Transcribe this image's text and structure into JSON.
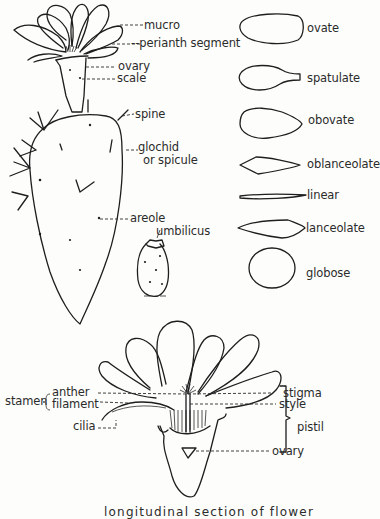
{
  "diagram": {
    "cactus_labels": {
      "mucro": "mucro",
      "perianth_segment": "perianth segment",
      "ovary": "ovary",
      "scale": "scale",
      "spine": "spine",
      "glochid_line1": "glochid",
      "glochid_line2": "or spicule",
      "areole": "areole",
      "umbilicus": "umbilicus"
    },
    "leaf_shapes": [
      {
        "name": "ovate"
      },
      {
        "name": "spatulate"
      },
      {
        "name": "obovate"
      },
      {
        "name": "oblanceolate"
      },
      {
        "name": "linear"
      },
      {
        "name": "lanceolate"
      },
      {
        "name": "globose"
      }
    ],
    "flower_section_labels": {
      "stamen": "stamen",
      "anther": "anther",
      "filament": "filament",
      "cilia": "cilia",
      "stigma": "stigma",
      "style": "style",
      "pistil": "pistil",
      "ovary": "ovary"
    },
    "caption": "longitudinal section of flower"
  }
}
